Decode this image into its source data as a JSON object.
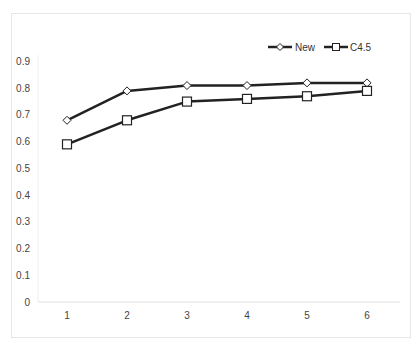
{
  "chart_data": {
    "type": "line",
    "title": "",
    "xlabel": "",
    "ylabel": "",
    "categories": [
      "1",
      "2",
      "3",
      "4",
      "5",
      "6"
    ],
    "x": [
      1,
      2,
      3,
      4,
      5,
      6
    ],
    "series": [
      {
        "name": "New",
        "marker": "diamond",
        "values": [
          0.68,
          0.79,
          0.81,
          0.81,
          0.82,
          0.82
        ]
      },
      {
        "name": "C4.5",
        "marker": "square",
        "values": [
          0.59,
          0.68,
          0.75,
          0.76,
          0.77,
          0.79
        ]
      }
    ],
    "ylim": [
      0,
      0.9
    ],
    "yticks": [
      "0",
      "0.1",
      "0.2",
      "0.3",
      "0.4",
      "0.5",
      "0.6",
      "0.7",
      "0.8",
      "0.9"
    ],
    "grid": false,
    "legend_position": "top-right",
    "line_color": "#222222"
  },
  "legend": {
    "items": [
      {
        "label": "New"
      },
      {
        "label": "C4.5"
      }
    ]
  }
}
